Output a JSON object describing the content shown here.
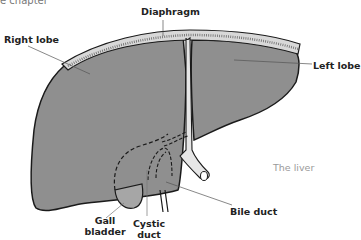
{
  "header": {
    "chapter_fragment": "e chapter"
  },
  "figure": {
    "caption": "The liver",
    "colors": {
      "liver_fill": "#8f8f8f",
      "outline": "#1a1a1a",
      "diaphragm_fill": "#d8d8d8",
      "duct_fill": "#e6e6e6",
      "caption_text": "#9a9a9a",
      "label_text": "#222222"
    },
    "labels": {
      "diaphragm": "Diaphragm",
      "right_lobe": "Right lobe",
      "left_lobe": "Left lobe",
      "bile_duct": "Bile duct",
      "gall_bladder_line1": "Gall",
      "gall_bladder_line2": "bladder",
      "cystic_duct_line1": "Cystic",
      "cystic_duct_line2": "duct"
    }
  }
}
